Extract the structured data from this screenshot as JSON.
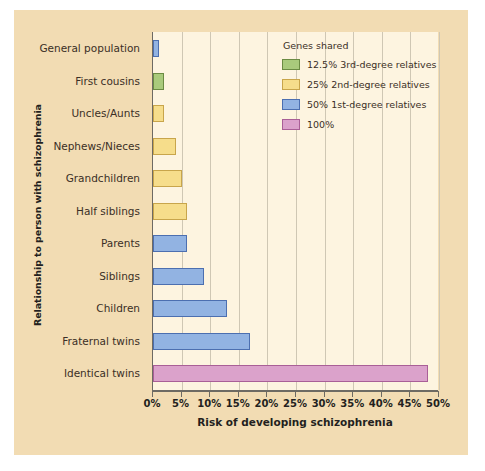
{
  "chart_data": {
    "type": "bar",
    "orientation": "horizontal",
    "title": "",
    "xlabel": "Risk of developing schizophrenia",
    "ylabel": "Relationship to person with schizophrenia",
    "xlim": [
      0,
      50
    ],
    "xticks": [
      "0%",
      "5%",
      "10%",
      "15%",
      "20%",
      "25%",
      "30%",
      "35%",
      "40%",
      "45%",
      "50%"
    ],
    "xtick_values": [
      0,
      5,
      10,
      15,
      20,
      25,
      30,
      35,
      40,
      45,
      50
    ],
    "grid": "vertical",
    "categories": [
      "General population",
      "First cousins",
      "Uncles/Aunts",
      "Nephews/Nieces",
      "Grandchildren",
      "Half siblings",
      "Parents",
      "Siblings",
      "Children",
      "Fraternal twins",
      "Identical twins"
    ],
    "values": [
      1,
      2,
      2,
      4,
      5,
      6,
      6,
      9,
      13,
      17,
      48
    ],
    "bar_colors": [
      "blue",
      "green",
      "yellow",
      "yellow",
      "yellow",
      "yellow",
      "blue",
      "blue",
      "blue",
      "blue",
      "pink"
    ],
    "legend": {
      "title": "Genes shared",
      "position": "top-right",
      "entries": [
        {
          "color_key": "green",
          "label": "12.5% 3rd-degree relatives",
          "hex": "#a9ca7c"
        },
        {
          "color_key": "yellow",
          "label": "25% 2nd-degree relatives",
          "hex": "#f6dd8b"
        },
        {
          "color_key": "blue",
          "label": "50% 1st-degree relatives",
          "hex": "#92b3e2"
        },
        {
          "color_key": "pink",
          "label": "100%",
          "hex": "#dba2cb"
        }
      ]
    },
    "colors": {
      "panel_background": "#f2dcb3",
      "plot_background": "#fdf4e0",
      "gridline": "#cfc7b4",
      "axis": "#6d6a63",
      "text": "#231f20"
    }
  }
}
